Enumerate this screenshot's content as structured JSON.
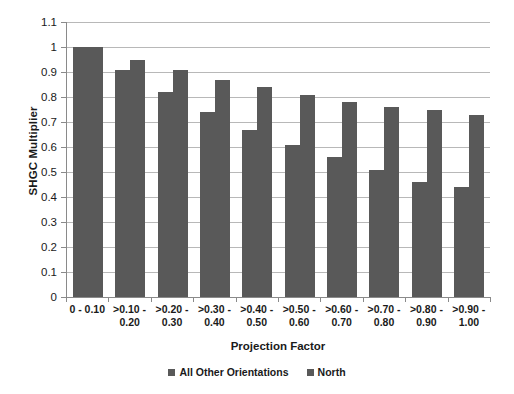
{
  "chart_data": {
    "type": "bar",
    "title": "",
    "xlabel": "Projection Factor",
    "ylabel": "SHGC Multiplier",
    "ylim": [
      0,
      1.1
    ],
    "grid": true,
    "legend_position": "bottom",
    "categories": [
      "0 - 0.10",
      ">0.10 - 0.20",
      ">0.20 - 0.30",
      ">0.30 - 0.40",
      ">0.40 - 0.50",
      ">0.50 - 0.60",
      ">0.60 - 0.70",
      ">0.70 - 0.80",
      ">0.80 - 0.90",
      ">0.90 - 1.00"
    ],
    "category_lines": [
      [
        "0 - 0.10",
        ""
      ],
      [
        ">0.10 -",
        "0.20"
      ],
      [
        ">0.20 -",
        "0.30"
      ],
      [
        ">0.30 -",
        "0.40"
      ],
      [
        ">0.40 -",
        "0.50"
      ],
      [
        ">0.50 -",
        "0.60"
      ],
      [
        ">0.60 -",
        "0.70"
      ],
      [
        ">0.70 -",
        "0.80"
      ],
      [
        ">0.80 -",
        "0.90"
      ],
      [
        ">0.90 -",
        "1.00"
      ]
    ],
    "yticks": [
      "1.1",
      "1",
      "0.9",
      "0.8",
      "0.7",
      "0.6",
      "0.5",
      "0.4",
      "0.3",
      "0.2",
      "0.1",
      "0"
    ],
    "ytick_values": [
      1.1,
      1.0,
      0.9,
      0.8,
      0.7,
      0.6,
      0.5,
      0.4,
      0.3,
      0.2,
      0.1,
      0
    ],
    "series": [
      {
        "name": "All Other Orientations",
        "color": "#595959",
        "values": [
          1.0,
          0.91,
          0.82,
          0.74,
          0.67,
          0.61,
          0.56,
          0.51,
          0.46,
          0.44
        ]
      },
      {
        "name": "North",
        "color": "#595959",
        "values": [
          1.0,
          0.95,
          0.91,
          0.87,
          0.84,
          0.81,
          0.78,
          0.76,
          0.75,
          0.73
        ]
      }
    ]
  },
  "legend": {
    "entries": [
      {
        "label": "All Other Orientations",
        "color": "#595959"
      },
      {
        "label": "North",
        "color": "#595959"
      }
    ]
  },
  "colors": {
    "bar": "#595959",
    "gridline": "#b8b8b8",
    "axis": "#8a8a8a",
    "text": "#1a1a1a",
    "background": "#ffffff"
  }
}
